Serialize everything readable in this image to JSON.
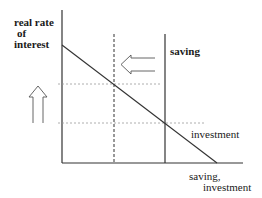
{
  "diagram": {
    "y_axis_label": [
      "real rate",
      "of",
      "interest"
    ],
    "x_axis_label": [
      "saving,",
      "investment"
    ],
    "curves": {
      "saving": "saving",
      "investment": "investment"
    },
    "arrows": {
      "left": "shift-left",
      "up": "shift-up"
    },
    "colors": {
      "line": "#333333",
      "dotted": "#9a9a9a"
    }
  }
}
